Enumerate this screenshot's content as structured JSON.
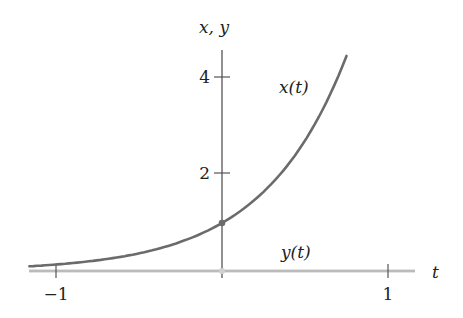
{
  "chart_data": {
    "type": "line",
    "title": "",
    "xlabel": "t",
    "ylabel": "x, y",
    "xlim": [
      -1.16,
      1.16
    ],
    "ylim": [
      0,
      4.7
    ],
    "x_ticks": [
      {
        "value": -1,
        "label": "−1"
      },
      {
        "value": 1,
        "label": "1"
      }
    ],
    "y_ticks": [
      {
        "value": 2,
        "label": "2"
      },
      {
        "value": 4,
        "label": "4"
      }
    ],
    "grid": false,
    "legend": "none",
    "series": [
      {
        "name": "x(t)",
        "label": "x(t)",
        "color": "#6b6b6b",
        "formula": "e^(2t)",
        "x": [
          -1.16,
          -1.0,
          -0.75,
          -0.5,
          -0.25,
          0.0,
          0.25,
          0.5,
          0.6,
          0.7,
          0.75
        ],
        "values": [
          0.1,
          0.14,
          0.22,
          0.37,
          0.61,
          1.0,
          1.65,
          2.72,
          3.32,
          4.06,
          4.48
        ]
      },
      {
        "name": "y(t)",
        "label": "y(t)",
        "color": "#c8c8c8",
        "formula": "0",
        "x": [
          -1.16,
          1.16
        ],
        "values": [
          0,
          0
        ]
      }
    ],
    "points": [
      {
        "x": 0,
        "y": 1,
        "series": "x(t)"
      },
      {
        "x": 0,
        "y": 0,
        "series": "y(t)"
      }
    ]
  },
  "labels": {
    "y_axis": "x, y",
    "t_axis": "t",
    "x_curve": "x(t)",
    "y_curve": "y(t)",
    "tick_neg1": "−1",
    "tick_1": "1",
    "tick_2": "2",
    "tick_4": "4"
  }
}
